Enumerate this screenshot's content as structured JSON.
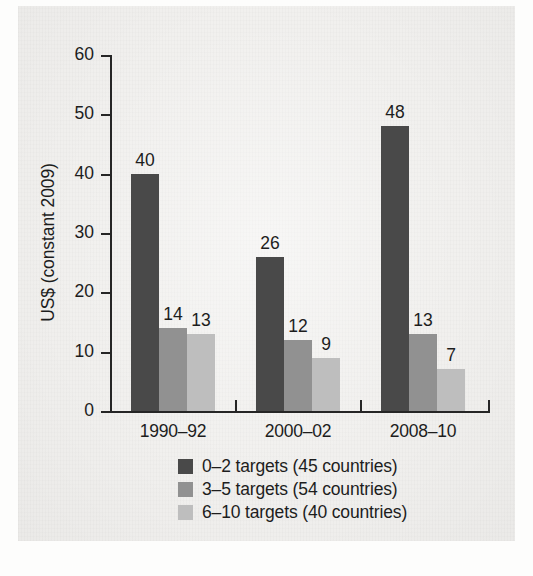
{
  "chart_data": {
    "type": "bar",
    "title": "",
    "xlabel": "",
    "ylabel": "US$ (constant 2009)",
    "ylim": [
      0,
      60
    ],
    "yticks": [
      0,
      10,
      20,
      30,
      40,
      50,
      60
    ],
    "ytick_labels": [
      "0",
      "10",
      "20",
      "30",
      "40",
      "50",
      "60"
    ],
    "grid": false,
    "legend_position": "bottom-center",
    "categories": [
      "1990–92",
      "2000–02",
      "2008–10"
    ],
    "series": [
      {
        "name": "0–2 targets (45 countries)",
        "color": "#494949",
        "values": [
          40,
          26,
          48
        ],
        "value_labels": [
          "40",
          "26",
          "48"
        ]
      },
      {
        "name": "3–5 targets (54 countries)",
        "color": "#919191",
        "values": [
          14,
          12,
          13
        ],
        "value_labels": [
          "14",
          "12",
          "13"
        ]
      },
      {
        "name": "6–10 targets (40 countries)",
        "color": "#bebebe",
        "values": [
          13,
          9,
          7
        ],
        "value_labels": [
          "13",
          "9",
          "7"
        ]
      }
    ]
  },
  "colors": {
    "page_background": "#fdfdfc",
    "figure_background": "#f1f0ee",
    "axis": "#262626",
    "text": "#1d1d1d",
    "series_dark": "#494949",
    "series_medium": "#919191",
    "series_light": "#bebebe"
  }
}
